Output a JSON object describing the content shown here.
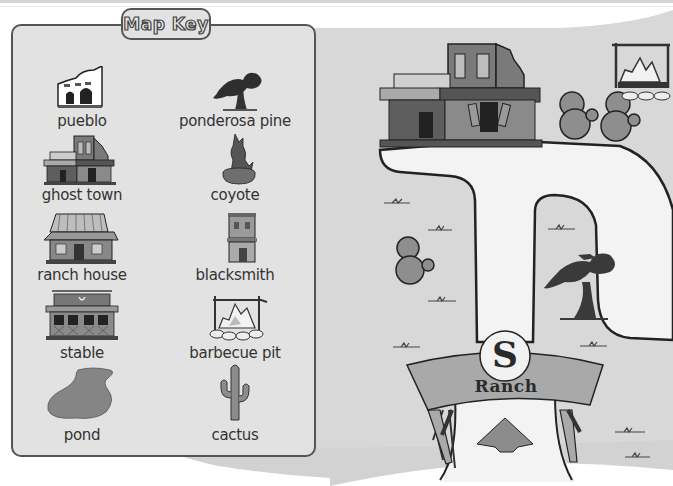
{
  "map_key": {
    "title": "Map Key",
    "items": [
      {
        "label": "pueblo",
        "icon": "pueblo-icon"
      },
      {
        "label": "ponderosa pine",
        "icon": "ponderosa-pine-icon"
      },
      {
        "label": "ghost town",
        "icon": "ghost-town-icon"
      },
      {
        "label": "coyote",
        "icon": "coyote-icon"
      },
      {
        "label": "ranch house",
        "icon": "ranch-house-icon"
      },
      {
        "label": "blacksmith",
        "icon": "blacksmith-icon"
      },
      {
        "label": "stable",
        "icon": "stable-icon"
      },
      {
        "label": "barbecue pit",
        "icon": "barbecue-pit-icon"
      },
      {
        "label": "pond",
        "icon": "pond-icon"
      },
      {
        "label": "cactus",
        "icon": "cactus-icon"
      }
    ]
  },
  "map": {
    "ranch_sign": {
      "letter": "S",
      "text": "Ranch"
    },
    "features": [
      "ghost-town",
      "cactus-pair",
      "barbecue-pit",
      "cactus",
      "ponderosa-pine",
      "ranch-gate",
      "trail"
    ]
  },
  "colors": {
    "background": "#ffffff",
    "map_ground": "#d9d9d9",
    "trail": "#f2f2f2",
    "key_panel": "#e2e2e2",
    "outline": "#333333",
    "sign": "#a9a9a9"
  }
}
